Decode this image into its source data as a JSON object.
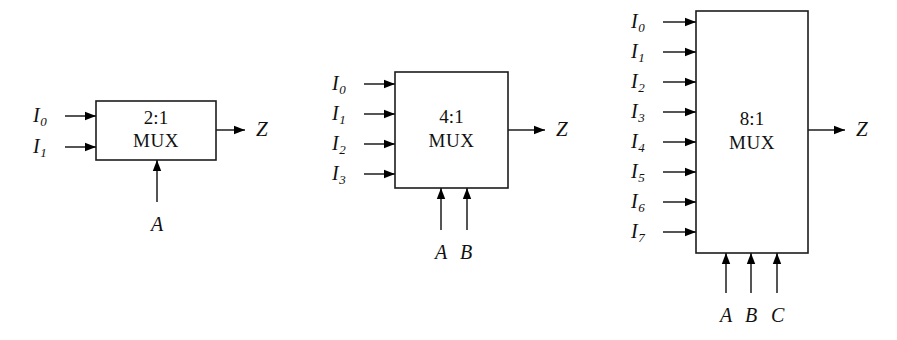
{
  "figure": {
    "background_color": "#ffffff",
    "line_color": "#1c1c1c"
  },
  "blocks": [
    {
      "id": "mux-2-1",
      "ratio": "2:1",
      "name": "MUX",
      "box": {
        "x": 96,
        "y": 101,
        "w": 120,
        "h": 59
      },
      "inputs": [
        {
          "label": "I",
          "sub": "0",
          "label_x": 33,
          "label_y": 105,
          "wire_y": 116
        },
        {
          "label": "I",
          "sub": "1",
          "label_x": 33,
          "label_y": 136,
          "wire_y": 147
        }
      ],
      "selects": [
        {
          "label": "A",
          "label_x": 151,
          "label_y": 214,
          "wire_x": 157
        }
      ],
      "output": {
        "label": "Z",
        "label_x": 256,
        "label_y": 119,
        "wire_y": 130,
        "wire_end_x": 245
      }
    },
    {
      "id": "mux-4-1",
      "ratio": "4:1",
      "name": "MUX",
      "box": {
        "x": 395,
        "y": 72,
        "w": 113,
        "h": 116
      },
      "inputs": [
        {
          "label": "I",
          "sub": "0",
          "label_x": 332,
          "label_y": 73,
          "wire_y": 84
        },
        {
          "label": "I",
          "sub": "1",
          "label_x": 332,
          "label_y": 103,
          "wire_y": 114
        },
        {
          "label": "I",
          "sub": "2",
          "label_x": 332,
          "label_y": 133,
          "wire_y": 144
        },
        {
          "label": "I",
          "sub": "3",
          "label_x": 332,
          "label_y": 163,
          "wire_y": 174
        }
      ],
      "selects": [
        {
          "label": "A",
          "label_x": 435,
          "label_y": 242,
          "wire_x": 441
        },
        {
          "label": "B",
          "label_x": 460,
          "label_y": 242,
          "wire_x": 467
        }
      ],
      "output": {
        "label": "Z",
        "label_x": 556,
        "label_y": 119,
        "wire_y": 130,
        "wire_end_x": 545
      }
    },
    {
      "id": "mux-8-1",
      "ratio": "8:1",
      "name": "MUX",
      "box": {
        "x": 696,
        "y": 11,
        "w": 112,
        "h": 242
      },
      "inputs": [
        {
          "label": "I",
          "sub": "0",
          "label_x": 631,
          "label_y": 11,
          "wire_y": 22
        },
        {
          "label": "I",
          "sub": "1",
          "label_x": 631,
          "label_y": 41,
          "wire_y": 52
        },
        {
          "label": "I",
          "sub": "2",
          "label_x": 631,
          "label_y": 71,
          "wire_y": 82
        },
        {
          "label": "I",
          "sub": "3",
          "label_x": 631,
          "label_y": 101,
          "wire_y": 112
        },
        {
          "label": "I",
          "sub": "4",
          "label_x": 631,
          "label_y": 131,
          "wire_y": 142
        },
        {
          "label": "I",
          "sub": "5",
          "label_x": 631,
          "label_y": 161,
          "wire_y": 172
        },
        {
          "label": "I",
          "sub": "6",
          "label_x": 631,
          "label_y": 191,
          "wire_y": 202
        },
        {
          "label": "I",
          "sub": "7",
          "label_x": 631,
          "label_y": 221,
          "wire_y": 232
        }
      ],
      "selects": [
        {
          "label": "A",
          "label_x": 720,
          "label_y": 305,
          "wire_x": 726
        },
        {
          "label": "B",
          "label_x": 745,
          "label_y": 305,
          "wire_x": 751
        },
        {
          "label": "C",
          "label_x": 771,
          "label_y": 305,
          "wire_x": 777
        }
      ],
      "output": {
        "label": "Z",
        "label_x": 856,
        "label_y": 119,
        "wire_y": 130,
        "wire_end_x": 845
      }
    }
  ]
}
